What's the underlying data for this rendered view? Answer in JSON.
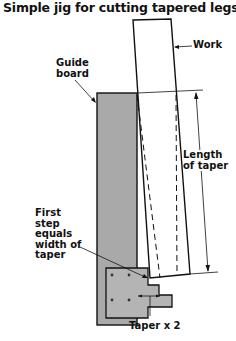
{
  "title": "Simple jig for cutting tapered legs",
  "labels": {
    "work": "Work",
    "guide_board_line1": "Guide",
    "guide_board_line2": "board",
    "length_line1": "Length",
    "length_line2": "of taper",
    "first_step_line1": "First",
    "first_step_line2": "step",
    "first_step_line3": "equals",
    "first_step_line4": "width of",
    "first_step_line5": "taper",
    "taper_x2": "Taper x 2"
  },
  "colors": {
    "guide_board_fill": "#a9a9a9",
    "step_block_fill": "#b4b4b4",
    "line": "#111111"
  }
}
